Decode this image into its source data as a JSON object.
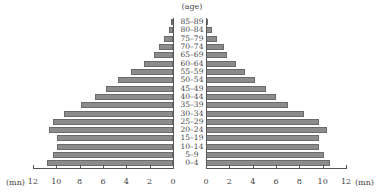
{
  "chart_data": {
    "type": "bar",
    "orientation": "horizontal",
    "subtype": "population-pyramid",
    "title": "",
    "category_axis_label": "(age)",
    "value_axis_unit": "(mn)",
    "categories": [
      "85–89",
      "80–84",
      "75–79",
      "70–74",
      "65–69",
      "60–64",
      "55–59",
      "50–54",
      "45–49",
      "40–44",
      "35–39",
      "30–34",
      "25–29",
      "20–24",
      "15–19",
      "10–14",
      "5–9",
      "0–4"
    ],
    "series": [
      {
        "name": "left",
        "side": "left",
        "values": [
          0.2,
          0.3,
          0.8,
          1.2,
          1.6,
          2.5,
          3.6,
          4.7,
          5.7,
          6.7,
          7.9,
          9.3,
          10.3,
          10.6,
          9.9,
          9.9,
          10.3,
          10.8
        ]
      },
      {
        "name": "right",
        "side": "right",
        "values": [
          0.2,
          0.5,
          0.9,
          1.5,
          1.8,
          2.6,
          3.3,
          4.2,
          5.1,
          6.0,
          7.0,
          8.4,
          9.7,
          10.4,
          9.7,
          9.7,
          10.1,
          10.6
        ]
      }
    ],
    "left_ticks": [
      "12",
      "10",
      "8",
      "6",
      "4",
      "2",
      "0"
    ],
    "right_ticks": [
      "0",
      "2",
      "4",
      "6",
      "8",
      "10",
      "12"
    ],
    "xlim": [
      0,
      12
    ],
    "grid": false,
    "legend": null
  },
  "labels": {
    "age_title": "(age)",
    "unit_left": "(mn)",
    "unit_right": "(mn)"
  },
  "colors": {
    "bar_fill": "#8c8c8c",
    "bar_edge": "#6a6a6a",
    "axis": "#555555"
  }
}
